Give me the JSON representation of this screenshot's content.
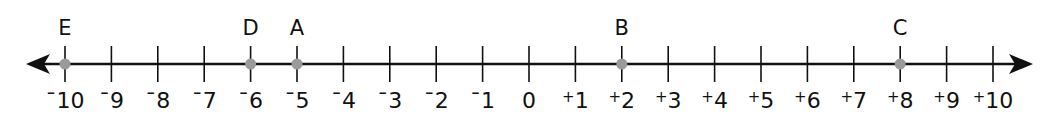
{
  "number_line": {
    "min": -10,
    "max": 10,
    "step": 1,
    "ticks": [
      {
        "value": -10,
        "sign": "-",
        "num": "10"
      },
      {
        "value": -9,
        "sign": "-",
        "num": "9"
      },
      {
        "value": -8,
        "sign": "-",
        "num": "8"
      },
      {
        "value": -7,
        "sign": "-",
        "num": "7"
      },
      {
        "value": -6,
        "sign": "-",
        "num": "6"
      },
      {
        "value": -5,
        "sign": "-",
        "num": "5"
      },
      {
        "value": -4,
        "sign": "-",
        "num": "4"
      },
      {
        "value": -3,
        "sign": "-",
        "num": "3"
      },
      {
        "value": -2,
        "sign": "-",
        "num": "2"
      },
      {
        "value": -1,
        "sign": "-",
        "num": "1"
      },
      {
        "value": 0,
        "sign": "",
        "num": "0"
      },
      {
        "value": 1,
        "sign": "+",
        "num": "1"
      },
      {
        "value": 2,
        "sign": "+",
        "num": "2"
      },
      {
        "value": 3,
        "sign": "+",
        "num": "3"
      },
      {
        "value": 4,
        "sign": "+",
        "num": "4"
      },
      {
        "value": 5,
        "sign": "+",
        "num": "5"
      },
      {
        "value": 6,
        "sign": "+",
        "num": "6"
      },
      {
        "value": 7,
        "sign": "+",
        "num": "7"
      },
      {
        "value": 8,
        "sign": "+",
        "num": "8"
      },
      {
        "value": 9,
        "sign": "+",
        "num": "9"
      },
      {
        "value": 10,
        "sign": "+",
        "num": "10"
      }
    ],
    "points": [
      {
        "label": "E",
        "value": -10
      },
      {
        "label": "D",
        "value": -6
      },
      {
        "label": "A",
        "value": -5
      },
      {
        "label": "B",
        "value": 2
      },
      {
        "label": "C",
        "value": 8
      }
    ],
    "colors": {
      "line": "#111111",
      "point": "#9a9a9a"
    },
    "arrows": [
      "left",
      "right"
    ]
  }
}
